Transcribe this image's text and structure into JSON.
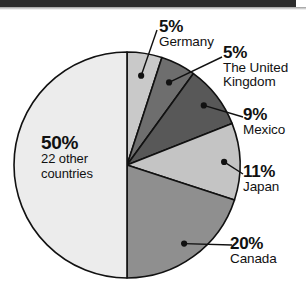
{
  "chart_data": {
    "type": "pie",
    "title": "",
    "subtitle": "",
    "xlabel": "",
    "ylabel": "",
    "legend_position": "none",
    "grid": false,
    "units": "percent",
    "total": 100,
    "start_angle_deg": 0,
    "direction": "clockwise",
    "categories": [
      "Germany",
      "The United Kingdom",
      "Mexico",
      "Japan",
      "Canada",
      "22 other countries"
    ],
    "values": [
      5,
      5,
      9,
      11,
      20,
      50
    ],
    "slices": [
      {
        "label": "Germany",
        "pct_text": "5%",
        "value": 5,
        "color": "#c9c9c9",
        "label_lines": [
          "Germany"
        ],
        "label_placement": "outside-top"
      },
      {
        "label": "The United Kingdom",
        "pct_text": "5%",
        "value": 5,
        "color": "#6e6e6e",
        "label_lines": [
          "The United",
          "Kingdom"
        ],
        "label_placement": "outside-right"
      },
      {
        "label": "Mexico",
        "pct_text": "9%",
        "value": 9,
        "color": "#585858",
        "label_lines": [
          "Mexico"
        ],
        "label_placement": "outside-right"
      },
      {
        "label": "Japan",
        "pct_text": "11%",
        "value": 11,
        "color": "#c4c4c4",
        "label_lines": [
          "Japan"
        ],
        "label_placement": "outside-right"
      },
      {
        "label": "Canada",
        "pct_text": "20%",
        "value": 20,
        "color": "#8f8f8f",
        "label_lines": [
          "Canada"
        ],
        "label_placement": "outside-bottom-right"
      },
      {
        "label": "22 other countries",
        "pct_text": "50%",
        "value": 50,
        "color": "#ececec",
        "label_lines": [
          "22 other",
          "countries"
        ],
        "label_placement": "inside-left"
      }
    ],
    "geometry": {
      "center_x": 127,
      "center_y": 165,
      "radius": 113,
      "stroke": "#111111",
      "stroke_width": 1.6
    }
  },
  "labels": {
    "germany": {
      "pct": "5%",
      "line1": "Germany",
      "line2": ""
    },
    "uk": {
      "pct": "5%",
      "line1": "The United",
      "line2": "Kingdom"
    },
    "mexico": {
      "pct": "9%",
      "line1": "Mexico",
      "line2": ""
    },
    "japan": {
      "pct": "11%",
      "line1": "Japan",
      "line2": ""
    },
    "canada": {
      "pct": "20%",
      "line1": "Canada",
      "line2": ""
    },
    "other": {
      "pct": "50%",
      "line1": "22 other",
      "line2": "countries"
    }
  },
  "colors": {
    "background": "#ffffff",
    "outline": "#111111",
    "scanbar": "#2b2b2b",
    "text": "#111111"
  }
}
